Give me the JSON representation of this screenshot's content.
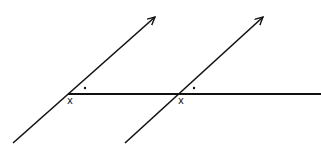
{
  "diagram": {
    "type": "geometry-parallel-lines-transversal",
    "stroke_color": "#111111",
    "horizontal_line": {
      "x1": 68,
      "y1": 94,
      "x2": 321,
      "y2": 94
    },
    "transversals": [
      {
        "x1": 13,
        "y1": 143,
        "x2": 155,
        "y2": 17,
        "arrow": true
      },
      {
        "x1": 125,
        "y1": 143,
        "x2": 263,
        "y2": 17,
        "arrow": true
      }
    ],
    "angle_labels": [
      {
        "text": "x",
        "x": 67,
        "y": 104
      },
      {
        "text": "x",
        "x": 178,
        "y": 104
      }
    ],
    "angle_dots": [
      {
        "x": 85,
        "y": 88
      },
      {
        "x": 194,
        "y": 88
      }
    ]
  }
}
